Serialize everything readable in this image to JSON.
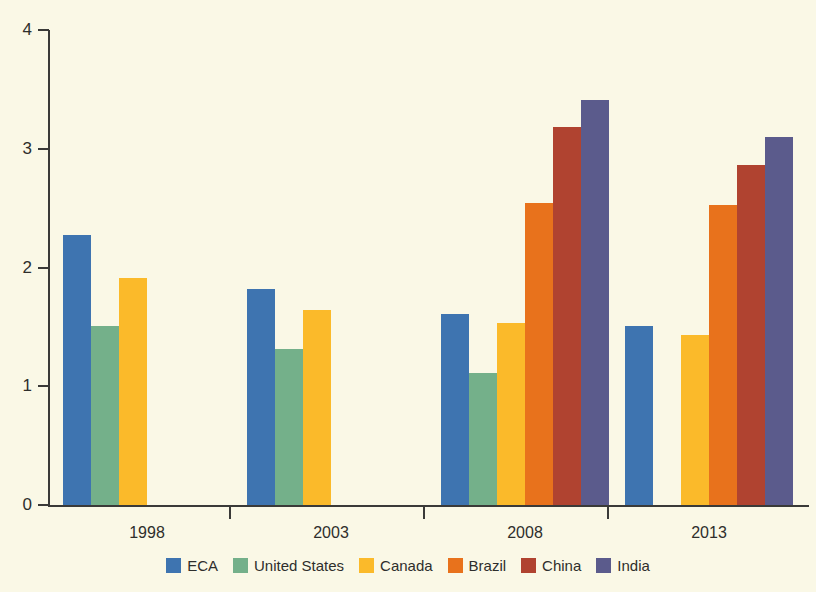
{
  "chart_data": {
    "type": "bar",
    "title": "",
    "subtitle": "",
    "xlabel": "",
    "ylabel": "",
    "categories": [
      "1998",
      "2003",
      "2008",
      "2013"
    ],
    "ylim": [
      0,
      4
    ],
    "yticks": [
      0,
      1,
      2,
      3,
      4
    ],
    "ytick_labels": [
      "0",
      "1",
      "2",
      "3",
      "4"
    ],
    "grid": false,
    "legend_position": "bottom",
    "series": [
      {
        "name": "ECA",
        "color": "#3e74b0",
        "values": [
          2.27,
          1.82,
          1.61,
          1.51
        ]
      },
      {
        "name": "United States",
        "color": "#74b08a",
        "values": [
          1.51,
          1.31,
          1.11,
          null
        ]
      },
      {
        "name": "Canada",
        "color": "#fbba2a",
        "values": [
          1.91,
          1.64,
          1.53,
          1.43
        ]
      },
      {
        "name": "Brazil",
        "color": "#e8721c",
        "values": [
          null,
          null,
          2.54,
          2.53
        ]
      },
      {
        "name": "China",
        "color": "#b04330",
        "values": [
          null,
          null,
          3.18,
          2.86
        ]
      },
      {
        "name": "India",
        "color": "#5b5b8c",
        "values": [
          null,
          null,
          3.41,
          3.1
        ]
      }
    ]
  },
  "axes": {
    "background_color": "#faf8e6",
    "axis_color": "#3a3a38"
  },
  "legend": {
    "items": [
      {
        "label": "ECA",
        "color": "#3e74b0"
      },
      {
        "label": "United States",
        "color": "#74b08a"
      },
      {
        "label": "Canada",
        "color": "#fbba2a"
      },
      {
        "label": "Brazil",
        "color": "#e8721c"
      },
      {
        "label": "China",
        "color": "#b04330"
      },
      {
        "label": "India",
        "color": "#5b5b8c"
      }
    ]
  }
}
